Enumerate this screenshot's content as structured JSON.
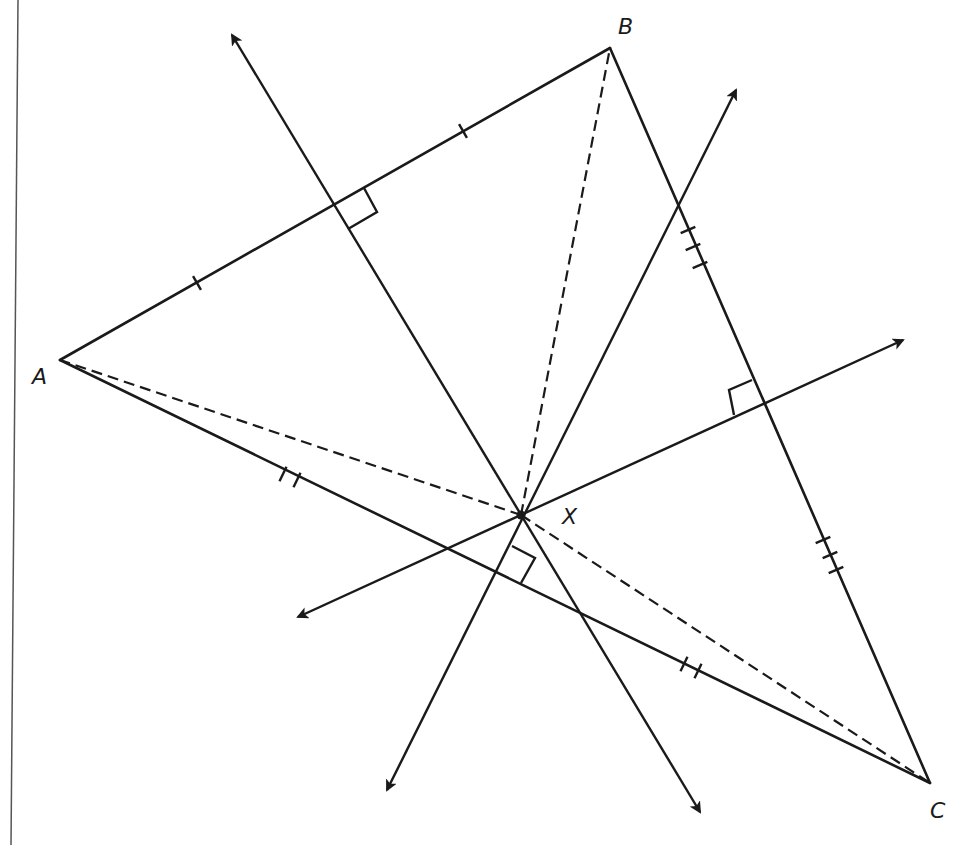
{
  "diagram": {
    "stroke_color": "#1a1a1a",
    "border_color": "#555555",
    "labels": {
      "A": "A",
      "B": "B",
      "C": "C",
      "X": "X"
    },
    "vertices": {
      "A": [
        60,
        360
      ],
      "B": [
        610,
        48
      ],
      "C": [
        930,
        783
      ],
      "X": [
        521,
        515
      ]
    },
    "label_positions": {
      "A": [
        32,
        366
      ],
      "B": [
        618,
        16
      ],
      "C": [
        930,
        800
      ],
      "X": [
        562,
        506
      ]
    },
    "sides": [
      {
        "from": "A",
        "to": "B",
        "tick_count": 1,
        "ticks": [
          [
            197,
            283
          ],
          [
            463,
            131
          ]
        ]
      },
      {
        "from": "B",
        "to": "C",
        "tick_count": 3,
        "ticks": [
          [
            688,
            230
          ],
          [
            693,
            247
          ],
          [
            700,
            265
          ],
          [
            823,
            540
          ],
          [
            830,
            555
          ],
          [
            836,
            570
          ]
        ]
      },
      {
        "from": "C",
        "to": "A",
        "tick_count": 2,
        "ticks": [
          [
            283,
            474
          ],
          [
            297,
            480
          ],
          [
            684,
            664
          ],
          [
            698,
            671
          ]
        ]
      }
    ],
    "dashed_segments": [
      {
        "from": "X",
        "to": "A"
      },
      {
        "from": "X",
        "to": "B"
      },
      {
        "from": "X",
        "to": "C"
      }
    ],
    "perpendicular_bisectors": [
      {
        "name": "bisector-AB",
        "start": [
          232,
          35
        ],
        "end": [
          700,
          812
        ],
        "foot": [
          335,
          204
        ],
        "right_angle_mark": [
          [
            335,
            204
          ],
          [
            364,
            188
          ],
          [
            377,
            212
          ],
          [
            348,
            229
          ]
        ]
      },
      {
        "name": "bisector-BC",
        "start": [
          298,
          617
        ],
        "end": [
          903,
          340
        ],
        "foot": [
          760,
          403
        ],
        "right_angle_mark": [
          [
            760,
            403
          ],
          [
            734,
            415
          ],
          [
            729,
            390
          ],
          [
            752,
            380
          ]
        ]
      },
      {
        "name": "bisector-CA",
        "start": [
          387,
          790
        ],
        "end": [
          736,
          90
        ],
        "foot": [
          497,
          568
        ],
        "right_angle_mark": [
          [
            497,
            568
          ],
          [
            512,
            546
          ],
          [
            535,
            558
          ],
          [
            521,
            583
          ]
        ]
      }
    ],
    "concurrency_point": "X"
  }
}
